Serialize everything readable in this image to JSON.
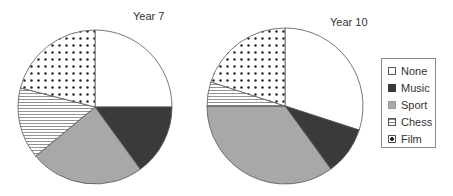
{
  "chart_data": [
    {
      "type": "pie",
      "title": "Year 7",
      "categories": [
        "None",
        "Music",
        "Sport",
        "Chess",
        "Film"
      ],
      "values": [
        25,
        15,
        24,
        15,
        21
      ],
      "start_angle": "12 o'clock",
      "direction": "clockwise"
    },
    {
      "type": "pie",
      "title": "Year 10",
      "categories": [
        "None",
        "Music",
        "Sport",
        "Chess",
        "Film"
      ],
      "values": [
        30,
        10,
        35,
        5,
        20
      ],
      "start_angle": "12 o'clock",
      "direction": "clockwise"
    }
  ],
  "legend": {
    "position": "right",
    "items": [
      {
        "label": "None",
        "fill": "white"
      },
      {
        "label": "Music",
        "fill": "#3a3a3a"
      },
      {
        "label": "Sport",
        "fill": "#a8a8a8"
      },
      {
        "label": "Chess",
        "fill": "horizontal-stripes"
      },
      {
        "label": "Film",
        "fill": "dots"
      }
    ]
  },
  "colors": {
    "none": "#ffffff",
    "music": "#3a3a3a",
    "sport": "#a8a8a8",
    "outline": "#555555"
  }
}
